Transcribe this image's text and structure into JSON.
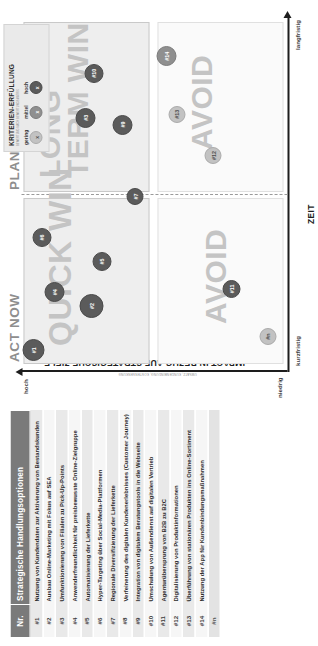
{
  "table": {
    "header_nr": "Nr.",
    "header_options": "Strategische Handlungsoptionen",
    "rows": [
      {
        "nr": "#1",
        "option": "Nutzung von Kundendaten zur Aktivierung von Bestandskunden"
      },
      {
        "nr": "#2",
        "option": "Ausbau Online-Marketing mit Fokus auf SEA"
      },
      {
        "nr": "#3",
        "option": "Umfunktionierung von Filialen zu Pick-Up-Points"
      },
      {
        "nr": "#4",
        "option": "Anwenderfreundlichkeit für preisbewusste Online-Zielgruppe"
      },
      {
        "nr": "#5",
        "option": "Automatisierung der Lieferkette"
      },
      {
        "nr": "#6",
        "option": "Hyper-Targeting über Social-Media-Plattformen"
      },
      {
        "nr": "#7",
        "option": "Regionale Diversifizierung der Lieferkette"
      },
      {
        "nr": "#8",
        "option": "Verfeinerung des digitalen Kundenerlebnisses (Customer Journey)"
      },
      {
        "nr": "#9",
        "option": "Integration von digitalem Beratungstools in die Webseite"
      },
      {
        "nr": "#10",
        "option": "Umschulung von Außendienst auf digitalen Vertrieb"
      },
      {
        "nr": "#11",
        "option": "Agenturübersprung von B2B zu B2C"
      },
      {
        "nr": "#12",
        "option": "Digitalisierung von Produktinformationen"
      },
      {
        "nr": "#13",
        "option": "Überführung von stationären Produkten ins Online-Sortiment"
      },
      {
        "nr": "#14",
        "option": "Nutzung der App für Kundenbindungsmaßnahmen"
      },
      {
        "nr": "#n",
        "option": ""
      }
    ]
  },
  "matrix": {
    "y_axis_title": "IMPACT IN BEZUG AUF STRATEGISCHE ZIELE",
    "y_axis_subtitle": "UMSATZ, KUNDENBINDUNG, KOSTENSENKUNG",
    "x_axis_title": "ZEIT",
    "y_tick_high": "hoch",
    "y_tick_low": "niedrig",
    "x_tick_left": "kurzfristig",
    "x_tick_right": "langfristig",
    "head_left": "ACT NOW",
    "head_right": "PLAN NOW",
    "word_quick_win": "QUICK WIN",
    "word_long_term_win": "LONG TERM WIN",
    "word_avoid_short": "AVOID",
    "word_avoid_long": "AVOID"
  },
  "legend": {
    "title": "KRITERIEN-ERFÜLLUNG",
    "subtitle": "BEWERTUNG NACH BEWERTUNGSMATRIX",
    "items": [
      {
        "label": "gering",
        "marker": "x",
        "level": "gering",
        "color": "#c2c2c2"
      },
      {
        "label": "mittel",
        "marker": "x",
        "level": "mittel",
        "color": "#8f8f8f"
      },
      {
        "label": "hoch",
        "marker": "x",
        "level": "hoch",
        "color": "#5b5b5b"
      }
    ]
  },
  "chart_data": {
    "type": "scatter",
    "xlabel": "ZEIT",
    "ylabel": "IMPACT IN BEZUG AUF STRATEGISCHE ZIELE",
    "xlim": [
      0,
      100
    ],
    "ylim": [
      0,
      100
    ],
    "x_ticks": [
      "kurzfristig",
      "langfristig"
    ],
    "y_ticks": [
      "niedrig",
      "hoch"
    ],
    "grid": false,
    "legend_position": "top-right",
    "quadrants": [
      {
        "name": "QUICK WIN",
        "x_range": [
          0,
          50
        ],
        "y_range": [
          50,
          100
        ],
        "header": "ACT NOW"
      },
      {
        "name": "LONG TERM WIN",
        "x_range": [
          50,
          100
        ],
        "y_range": [
          50,
          100
        ],
        "header": "PLAN NOW"
      },
      {
        "name": "AVOID",
        "x_range": [
          0,
          50
        ],
        "y_range": [
          0,
          50
        ],
        "header": "ACT NOW"
      },
      {
        "name": "AVOID",
        "x_range": [
          50,
          100
        ],
        "y_range": [
          0,
          50
        ],
        "header": "PLAN NOW"
      }
    ],
    "points": [
      {
        "id": "#1",
        "x": 4,
        "y": 96,
        "size": 22,
        "fill": "hoch",
        "quadrant": "QUICK WIN"
      },
      {
        "id": "#2",
        "x": 17,
        "y": 74,
        "size": 24,
        "fill": "hoch",
        "quadrant": "QUICK WIN"
      },
      {
        "id": "#4",
        "x": 21,
        "y": 88,
        "size": 20,
        "fill": "hoch",
        "quadrant": "QUICK WIN"
      },
      {
        "id": "#5",
        "x": 30,
        "y": 70,
        "size": 19,
        "fill": "hoch",
        "quadrant": "QUICK WIN"
      },
      {
        "id": "#6",
        "x": 37,
        "y": 93,
        "size": 19,
        "fill": "hoch",
        "quadrant": "QUICK WIN"
      },
      {
        "id": "#7",
        "x": 49,
        "y": 57,
        "size": 17,
        "fill": "hoch",
        "quadrant": "QUICK WIN"
      },
      {
        "id": "#3",
        "x": 72,
        "y": 76,
        "size": 20,
        "fill": "hoch",
        "quadrant": "LONG TERM WIN"
      },
      {
        "id": "#9",
        "x": 70,
        "y": 62,
        "size": 20,
        "fill": "hoch",
        "quadrant": "LONG TERM WIN"
      },
      {
        "id": "#10",
        "x": 85,
        "y": 73,
        "size": 19,
        "fill": "hoch",
        "quadrant": "LONG TERM WIN"
      },
      {
        "id": "#11",
        "x": 22,
        "y": 20,
        "size": 18,
        "fill": "hoch",
        "quadrant": "AVOID"
      },
      {
        "id": "#n",
        "x": 8,
        "y": 6,
        "size": 17,
        "fill": "gering",
        "quadrant": "AVOID"
      },
      {
        "id": "#12",
        "x": 61,
        "y": 27,
        "size": 17,
        "fill": "gering",
        "quadrant": "AVOID"
      },
      {
        "id": "#13",
        "x": 73,
        "y": 41,
        "size": 17,
        "fill": "gering",
        "quadrant": "AVOID"
      },
      {
        "id": "#14",
        "x": 90,
        "y": 45,
        "size": 20,
        "fill": "mittel",
        "quadrant": "AVOID"
      }
    ]
  }
}
